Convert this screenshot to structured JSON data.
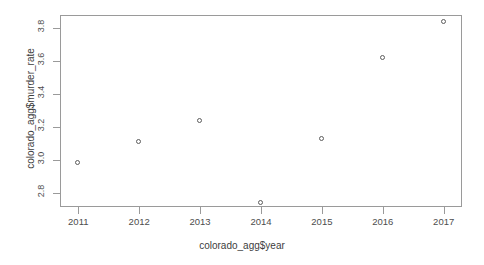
{
  "chart_data": {
    "type": "scatter",
    "title": "",
    "xlabel": "colorado_agg$year",
    "ylabel": "colorado_agg$murder_rate",
    "x": [
      2011,
      2012,
      2013,
      2014,
      2015,
      2016,
      2017
    ],
    "values": [
      2.98,
      3.11,
      3.24,
      2.74,
      3.13,
      3.62,
      3.84
    ],
    "series": [
      {
        "name": "murder_rate",
        "values": [
          2.98,
          3.11,
          3.24,
          2.74,
          3.13,
          3.62,
          3.84
        ]
      }
    ],
    "points": [
      {
        "x": 2011,
        "y": 2.98
      },
      {
        "x": 2012,
        "y": 3.11
      },
      {
        "x": 2013,
        "y": 3.24
      },
      {
        "x": 2014,
        "y": 2.74
      },
      {
        "x": 2015,
        "y": 3.13
      },
      {
        "x": 2016,
        "y": 3.62
      },
      {
        "x": 2017,
        "y": 3.84
      }
    ],
    "xticks": [
      "2011",
      "2012",
      "2013",
      "2014",
      "2015",
      "2016",
      "2017"
    ],
    "xtick_values": [
      2011,
      2012,
      2013,
      2014,
      2015,
      2016,
      2017
    ],
    "yticks": [
      "2.8",
      "3.0",
      "3.2",
      "3.4",
      "3.6",
      "3.8"
    ],
    "ytick_values": [
      2.8,
      3.0,
      3.2,
      3.4,
      3.6,
      3.8
    ],
    "xlim": [
      2010.7,
      2017.3
    ],
    "ylim": [
      2.715,
      3.88
    ],
    "grid": false,
    "legend": null,
    "marker": "open-circle",
    "marker_color": "#5c5c5c",
    "axis_color": "#9a9a9a",
    "background": "#ffffff"
  }
}
